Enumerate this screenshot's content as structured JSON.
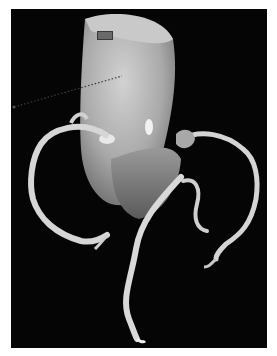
{
  "image": {
    "description": "3D volume-rendered CT of the heart/aortic root with coronary arteries on a black background",
    "background": "#050505",
    "page_background": "#ffffff",
    "tissue_color": "#bdbdbd",
    "vessel_color": "#d9d9d9",
    "annotation": {
      "type": "dotted-measure-line",
      "color": "#3c3c3c"
    }
  }
}
